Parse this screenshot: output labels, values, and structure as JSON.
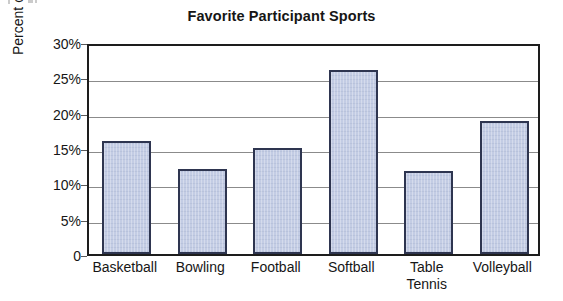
{
  "chart_data": {
    "type": "bar",
    "title": "Favorite Participant Sports",
    "xlabel": "",
    "ylabel": "Percent of Students Surveyed",
    "categories": [
      "Basketball",
      "Bowling",
      "Football",
      "Softball",
      "Table Tennis",
      "Volleyball"
    ],
    "category_lines": [
      [
        "Basketball"
      ],
      [
        "Bowling"
      ],
      [
        "Football"
      ],
      [
        "Softball"
      ],
      [
        "Table",
        "Tennis"
      ],
      [
        "Volleyball"
      ]
    ],
    "values": [
      16,
      12,
      15,
      26,
      11.8,
      18.8
    ],
    "value_labels": [
      "16%",
      "12%",
      "15%",
      "26%",
      "11.8%",
      "18.8%"
    ],
    "ylim": [
      0,
      30
    ],
    "ytick_values": [
      0,
      5,
      10,
      15,
      20,
      25,
      30
    ],
    "ytick_labels": [
      "0",
      "5%",
      "10%",
      "15%",
      "20%",
      "25%",
      "30%"
    ],
    "grid": true,
    "legend": false,
    "legend_position": "none",
    "bar_fill_color": "#c3cce4",
    "bar_border_color": "#2e3550",
    "gridline_color": "#8b8b8b",
    "frame_color": "#1d1d1d",
    "background_color": "#ffffff"
  }
}
